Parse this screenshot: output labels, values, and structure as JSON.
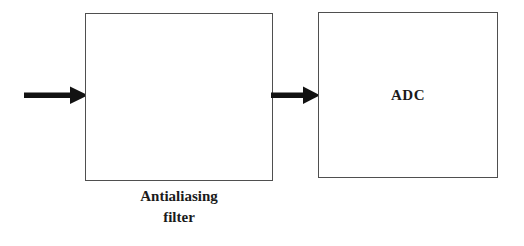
{
  "diagram": {
    "background_color": "#ffffff",
    "border_color": "#4f4f4f",
    "arrow_color": "#121212",
    "text_color": "#1b1b1b",
    "blocks": [
      {
        "id": "antialiasing-filter",
        "inner_label": "",
        "caption_lines": [
          "Antialiasing",
          "filter"
        ],
        "caption_position": "below"
      },
      {
        "id": "adc",
        "inner_label": "ADC",
        "caption_lines": [],
        "caption_position": "inside"
      }
    ],
    "arrows": [
      {
        "id": "input-arrow",
        "label": "",
        "from": "signal-input",
        "to": "antialiasing-filter",
        "direction": "right"
      },
      {
        "id": "filter-to-adc-arrow",
        "label": "",
        "from": "antialiasing-filter",
        "to": "adc",
        "direction": "right"
      }
    ]
  }
}
